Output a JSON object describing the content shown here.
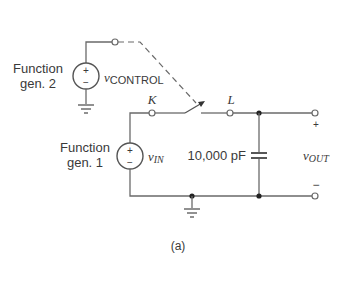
{
  "diagram": {
    "type": "circuit-schematic",
    "caption": "(a)",
    "sources": [
      {
        "id": "fg2",
        "label_line1": "Function",
        "label_line2": "gen. 2",
        "signal": "v",
        "signal_sub": "CONTROL",
        "plus": "+",
        "minus": "−"
      },
      {
        "id": "fg1",
        "label_line1": "Function",
        "label_line2": "gen. 1",
        "signal": "v",
        "signal_sub": "IN",
        "plus": "+",
        "minus": "−"
      }
    ],
    "nodes": {
      "k": "K",
      "l": "L"
    },
    "capacitor": {
      "value": "10,000 pF"
    },
    "output": {
      "signal": "v",
      "signal_sub": "OUT",
      "plus": "+",
      "minus": "−"
    }
  }
}
